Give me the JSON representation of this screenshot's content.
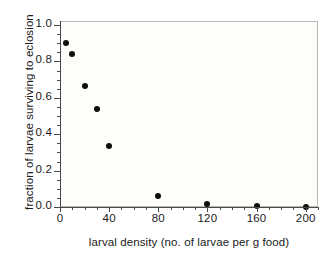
{
  "chart_data": {
    "type": "scatter",
    "title": "",
    "xlabel": "larval density (no. of larvae per g food)",
    "ylabel": "fraction of larvae surviving to eclosion",
    "xlim": [
      0,
      210
    ],
    "ylim": [
      0.0,
      1.05
    ],
    "grid": false,
    "legend": null,
    "x_ticks": [
      {
        "value": 0,
        "label": "0"
      },
      {
        "value": 40,
        "label": "40"
      },
      {
        "value": 80,
        "label": "80"
      },
      {
        "value": 120,
        "label": "120"
      },
      {
        "value": 160,
        "label": "160"
      },
      {
        "value": 200,
        "label": "200"
      }
    ],
    "x_minor_tick_interval": 10,
    "y_ticks": [
      {
        "value": 0.0,
        "label": "0.0"
      },
      {
        "value": 0.2,
        "label": "0.2"
      },
      {
        "value": 0.4,
        "label": "0.4"
      },
      {
        "value": 0.6,
        "label": "0.6"
      },
      {
        "value": 0.8,
        "label": "0.8"
      },
      {
        "value": 1.0,
        "label": "1.0"
      }
    ],
    "y_minor_tick_interval": 0.05,
    "x": [
      5,
      10,
      20,
      30,
      40,
      80,
      120,
      160,
      200
    ],
    "y": [
      0.9,
      0.84,
      0.665,
      0.54,
      0.335,
      0.06,
      0.015,
      0.003,
      0.0
    ],
    "points": [
      {
        "x": 5,
        "y": 0.9
      },
      {
        "x": 10,
        "y": 0.84
      },
      {
        "x": 20,
        "y": 0.665
      },
      {
        "x": 30,
        "y": 0.54
      },
      {
        "x": 40,
        "y": 0.335
      },
      {
        "x": 80,
        "y": 0.06
      },
      {
        "x": 120,
        "y": 0.015
      },
      {
        "x": 160,
        "y": 0.003
      },
      {
        "x": 200,
        "y": 0.0
      }
    ],
    "marker": "filled-circle",
    "marker_color": "#0d0d0d",
    "plot_background": "#fdfdfa",
    "frame_color": "#b9b9b4",
    "axis_color": "#4a4a4a"
  },
  "caption": ""
}
